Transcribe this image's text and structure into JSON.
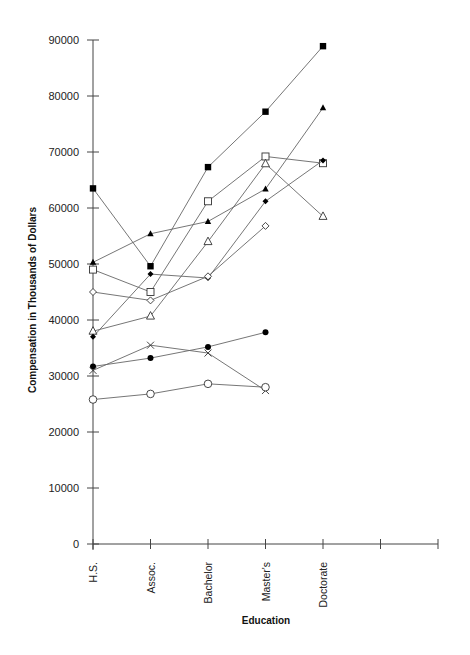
{
  "chart_data": {
    "type": "line",
    "title": "",
    "xlabel": "Education",
    "ylabel": "Compensation in Thousands of Dollars",
    "categories": [
      "H.S.",
      "Assoc.",
      "Bachelor",
      "Master's",
      "Doctorate"
    ],
    "extra_x_ticks": 2,
    "ylim": [
      0,
      90000
    ],
    "yticks": [
      0,
      10000,
      20000,
      30000,
      40000,
      50000,
      60000,
      70000,
      80000,
      90000
    ],
    "grid": false,
    "legend": "none",
    "series": [
      {
        "name": "filled-square",
        "marker": "square-filled",
        "values": [
          63500,
          49600,
          67300,
          77200,
          88900
        ]
      },
      {
        "name": "filled-triangle",
        "marker": "triangle-filled",
        "values": [
          50300,
          55400,
          57600,
          63400,
          77900
        ]
      },
      {
        "name": "open-square",
        "marker": "square-open",
        "values": [
          49000,
          45000,
          61200,
          69200,
          68000
        ]
      },
      {
        "name": "open-triangle",
        "marker": "triangle-open",
        "values": [
          38000,
          40700,
          54000,
          67900,
          58500
        ]
      },
      {
        "name": "filled-diamond",
        "marker": "diamond-filled",
        "values": [
          37000,
          48200,
          47500,
          61200,
          68500
        ]
      },
      {
        "name": "open-diamond",
        "marker": "diamond-open",
        "values": [
          45000,
          43500,
          47800,
          56800,
          null
        ]
      },
      {
        "name": "filled-circle",
        "marker": "circle-filled",
        "values": [
          31700,
          33200,
          35200,
          37800,
          null
        ]
      },
      {
        "name": "cross",
        "marker": "x",
        "values": [
          31000,
          35500,
          34100,
          27400,
          null
        ]
      },
      {
        "name": "open-circle",
        "marker": "circle-open",
        "values": [
          25800,
          26800,
          28600,
          28000,
          null
        ]
      }
    ]
  }
}
